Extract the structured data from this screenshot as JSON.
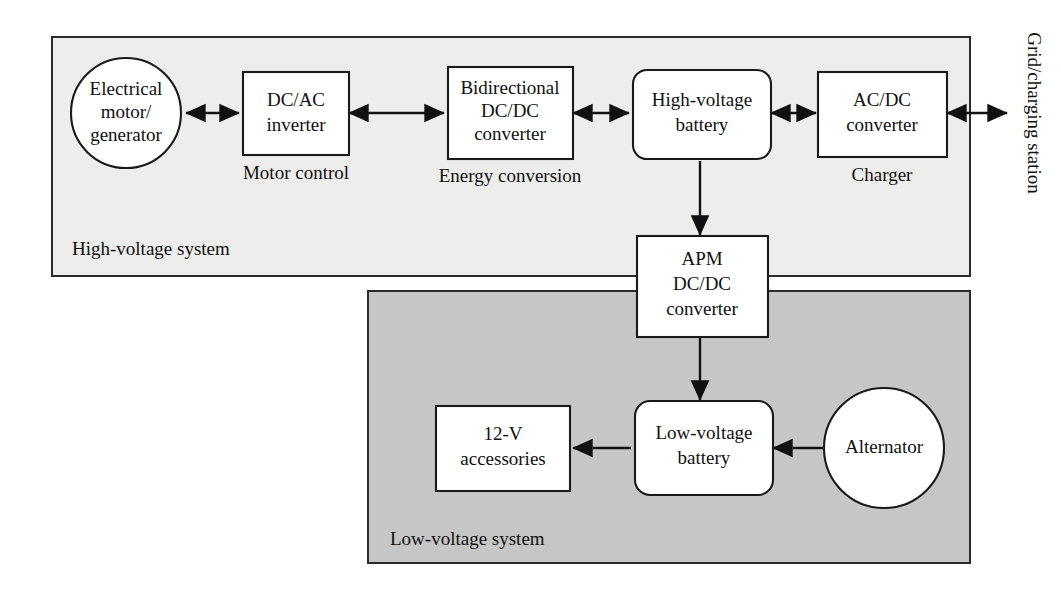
{
  "diagram": {
    "colors": {
      "high_voltage_panel_fill": "#ededec",
      "low_voltage_panel_fill": "#c6c6c6",
      "node_fill": "#ffffff",
      "stroke": "#111111",
      "background": "#ffffff"
    },
    "panels": [
      {
        "id": "high-voltage-system",
        "label": "High-voltage system",
        "fill": "#ededec"
      },
      {
        "id": "low-voltage-system",
        "label": "Low-voltage system",
        "fill": "#c6c6c6"
      }
    ],
    "nodes": [
      {
        "id": "electrical-motor-generator",
        "shape": "circle",
        "lines": [
          "Electrical",
          "motor/",
          "generator"
        ]
      },
      {
        "id": "dc-ac-inverter",
        "shape": "rect",
        "lines": [
          "DC/AC",
          "inverter"
        ],
        "caption": "Motor control"
      },
      {
        "id": "bidirectional-dc-dc-converter",
        "shape": "rect",
        "lines": [
          "Bidirectional",
          "DC/DC",
          "converter"
        ],
        "caption": "Energy conversion"
      },
      {
        "id": "high-voltage-battery",
        "shape": "rounded-rect",
        "lines": [
          "High-voltage",
          "battery"
        ]
      },
      {
        "id": "ac-dc-converter",
        "shape": "rect",
        "lines": [
          "AC/DC",
          "converter"
        ],
        "caption": "Charger"
      },
      {
        "id": "apm-dc-dc-converter",
        "shape": "rect",
        "lines": [
          "APM",
          "DC/DC",
          "converter"
        ]
      },
      {
        "id": "low-voltage-battery",
        "shape": "rounded-rect",
        "lines": [
          "Low-voltage",
          "battery"
        ]
      },
      {
        "id": "twelve-volt-accessories",
        "shape": "rect",
        "lines": [
          "12-V",
          "accessories"
        ]
      },
      {
        "id": "alternator",
        "shape": "circle",
        "lines": [
          "Alternator"
        ]
      }
    ],
    "external_label": {
      "id": "grid-charging-station",
      "text": "Grid/charging station",
      "orientation": "vertical"
    },
    "connections": [
      {
        "id": "motor-to-inverter",
        "from": "electrical-motor-generator",
        "to": "dc-ac-inverter",
        "arrows": "both"
      },
      {
        "id": "inverter-to-bidirectional",
        "from": "dc-ac-inverter",
        "to": "bidirectional-dc-dc-converter",
        "arrows": "both"
      },
      {
        "id": "bidirectional-to-hv-battery",
        "from": "bidirectional-dc-dc-converter",
        "to": "high-voltage-battery",
        "arrows": "both"
      },
      {
        "id": "hv-battery-to-acdc",
        "from": "high-voltage-battery",
        "to": "ac-dc-converter",
        "arrows": "both"
      },
      {
        "id": "acdc-to-grid",
        "from": "ac-dc-converter",
        "to": "grid-charging-station",
        "arrows": "both"
      },
      {
        "id": "hv-battery-to-apm",
        "from": "high-voltage-battery",
        "to": "apm-dc-dc-converter",
        "arrows": "forward"
      },
      {
        "id": "apm-to-lv-battery",
        "from": "apm-dc-dc-converter",
        "to": "low-voltage-battery",
        "arrows": "forward"
      },
      {
        "id": "lv-battery-to-accessories",
        "from": "low-voltage-battery",
        "to": "twelve-volt-accessories",
        "arrows": "forward"
      },
      {
        "id": "alternator-to-lv-battery",
        "from": "alternator",
        "to": "low-voltage-battery",
        "arrows": "forward"
      }
    ]
  }
}
